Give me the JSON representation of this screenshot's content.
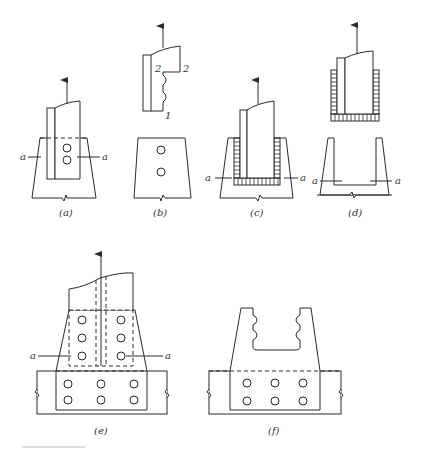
{
  "figure": {
    "panels": [
      {
        "id": "a",
        "caption": "(a)",
        "section_label_left": "a",
        "section_label_right": "a"
      },
      {
        "id": "b",
        "caption": "(b)",
        "labels": {
          "upper_left": "2",
          "upper_right": "2",
          "lower": "1"
        }
      },
      {
        "id": "c",
        "caption": "(c)",
        "section_label_left": "a",
        "section_label_right": "a"
      },
      {
        "id": "d",
        "caption": "(d)",
        "section_label_left": "a",
        "section_label_right": "a"
      },
      {
        "id": "e",
        "caption": "(e)",
        "section_label_left": "a",
        "section_label_right": "a"
      },
      {
        "id": "f",
        "caption": "(f)"
      }
    ]
  }
}
